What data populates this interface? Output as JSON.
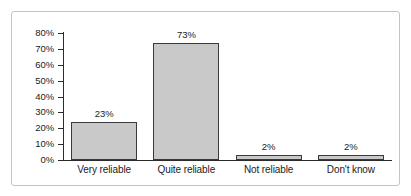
{
  "figure": {
    "frame": {
      "border_color": "#c4c4c4",
      "background": "#ffffff"
    }
  },
  "chart_data": {
    "type": "bar",
    "title": "",
    "subtitle": "",
    "xlabel": "",
    "ylabel": "",
    "categories": [
      "Very reliable",
      "Quite reliable",
      "Not reliable",
      "Don't know"
    ],
    "values": [
      23,
      73,
      2,
      2
    ],
    "value_labels": [
      "23%",
      "73%",
      "2%",
      "2%"
    ],
    "ylim": [
      0,
      80
    ],
    "ytick_values": [
      0,
      10,
      20,
      30,
      40,
      50,
      60,
      70,
      80
    ],
    "ytick_labels": [
      "0%",
      "10%",
      "20%",
      "30%",
      "40%",
      "50%",
      "60%",
      "70%",
      "80%"
    ],
    "grid": false,
    "legend": null,
    "bar_fill_color": "#c9c9c9",
    "bar_edge_color": "#3a3a3a",
    "axis_color": "#2b2b2b",
    "text_color": "#1b1b1b"
  }
}
